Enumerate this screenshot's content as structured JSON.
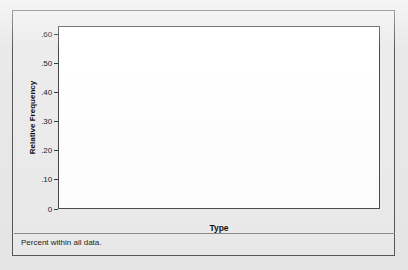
{
  "chart_data": {
    "type": "bar",
    "title": "",
    "subtitle": "",
    "xlabel": "Type",
    "ylabel": "Relative Frequency",
    "categories": [
      "Legs",
      "Wheels",
      "None",
      "Both"
    ],
    "values": [
      0.59,
      0.188,
      0.14,
      0.072
    ],
    "ylim": [
      0,
      0.63
    ],
    "yticks": [
      0,
      0.1,
      0.2,
      0.3,
      0.4,
      0.5,
      0.6
    ],
    "ytick_labels": [
      "0",
      ".10",
      ".20",
      ".30",
      ".40",
      ".50",
      ".60"
    ],
    "grid": false,
    "legend": "none",
    "footnote": "Percent within all data.",
    "bar_fill": "#c2c2c2",
    "bar_border": "#6d6d6f",
    "plot_background": "#ffffff",
    "panel_background": "#ececec",
    "frame_color": "#58585a"
  }
}
